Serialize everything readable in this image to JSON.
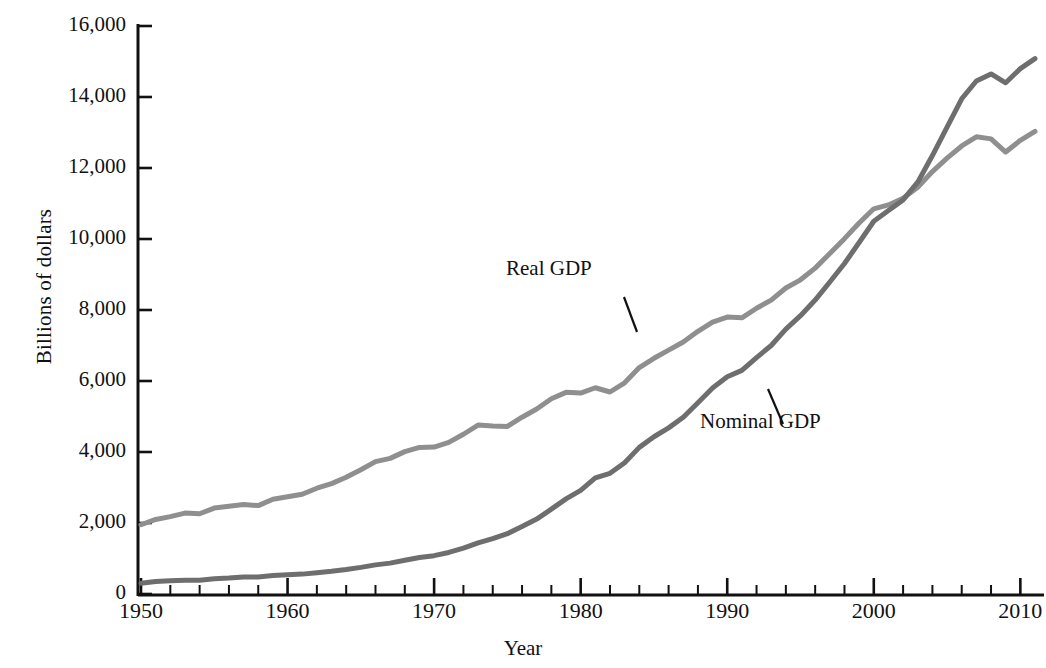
{
  "chart_data": {
    "type": "line",
    "title": "",
    "subtitle": "",
    "xlabel": "Year",
    "ylabel": "Billions of dollars",
    "xlim": [
      1950,
      2011
    ],
    "ylim": [
      0,
      16000
    ],
    "grid": false,
    "legend_position": "inline-annotation",
    "ytick_labels": [
      "0",
      "2,000",
      "4,000",
      "6,000",
      "8,000",
      "10,000",
      "12,000",
      "14,000",
      "16,000"
    ],
    "ytick_values": [
      0,
      2000,
      4000,
      6000,
      8000,
      10000,
      12000,
      14000,
      16000
    ],
    "xtick_labels": [
      "1950",
      "1960",
      "1970",
      "1980",
      "1990",
      "2000",
      "2010"
    ],
    "xtick_values": [
      1950,
      1960,
      1970,
      1980,
      1990,
      2000,
      2010
    ],
    "x_minor_tick_interval": 2,
    "x": [
      1950,
      1951,
      1952,
      1953,
      1954,
      1955,
      1956,
      1957,
      1958,
      1959,
      1960,
      1961,
      1962,
      1963,
      1964,
      1965,
      1966,
      1967,
      1968,
      1969,
      1970,
      1971,
      1972,
      1973,
      1974,
      1975,
      1976,
      1977,
      1978,
      1979,
      1980,
      1981,
      1982,
      1983,
      1984,
      1985,
      1986,
      1987,
      1988,
      1989,
      1990,
      1991,
      1992,
      1993,
      1994,
      1995,
      1996,
      1997,
      1998,
      1999,
      2000,
      2001,
      2002,
      2003,
      2004,
      2005,
      2006,
      2007,
      2008,
      2009,
      2010,
      2011
    ],
    "series": [
      {
        "name": "Real GDP",
        "color": "#8f8f8f",
        "annotation_label": "Real GDP",
        "values": [
          1950,
          2100,
          2180,
          2280,
          2260,
          2420,
          2470,
          2520,
          2490,
          2670,
          2740,
          2810,
          2980,
          3110,
          3290,
          3500,
          3730,
          3820,
          4010,
          4130,
          4140,
          4270,
          4500,
          4760,
          4730,
          4720,
          4980,
          5210,
          5500,
          5680,
          5660,
          5810,
          5690,
          5950,
          6380,
          6640,
          6870,
          7100,
          7400,
          7660,
          7800,
          7780,
          8050,
          8280,
          8620,
          8850,
          9180,
          9590,
          10010,
          10450,
          10850,
          10960,
          11150,
          11460,
          11900,
          12280,
          12620,
          12880,
          12820,
          12450,
          12780,
          13030
        ]
      },
      {
        "name": "Nominal GDP",
        "color": "#6e6e6e",
        "annotation_label": "Nominal GDP",
        "values": [
          300,
          350,
          370,
          390,
          390,
          430,
          450,
          480,
          480,
          520,
          540,
          560,
          600,
          640,
          690,
          750,
          820,
          870,
          950,
          1030,
          1080,
          1170,
          1290,
          1440,
          1560,
          1700,
          1900,
          2110,
          2390,
          2680,
          2920,
          3270,
          3400,
          3700,
          4130,
          4430,
          4680,
          4980,
          5390,
          5800,
          6120,
          6300,
          6660,
          7000,
          7460,
          7840,
          8280,
          8790,
          9310,
          9900,
          10500,
          10800,
          11100,
          11600,
          12350,
          13150,
          13950,
          14450,
          14650,
          14400,
          14800,
          15080
        ]
      }
    ],
    "annotations": [
      {
        "text": "Real GDP",
        "target_year": 1984,
        "note": "leader line points down-right to the Real GDP curve"
      },
      {
        "text": "Nominal GDP",
        "target_year": 1995,
        "note": "leader line points up-left to the Nominal GDP curve"
      }
    ]
  },
  "axis": {
    "y_title": "Billions of dollars",
    "x_title": "Year"
  }
}
